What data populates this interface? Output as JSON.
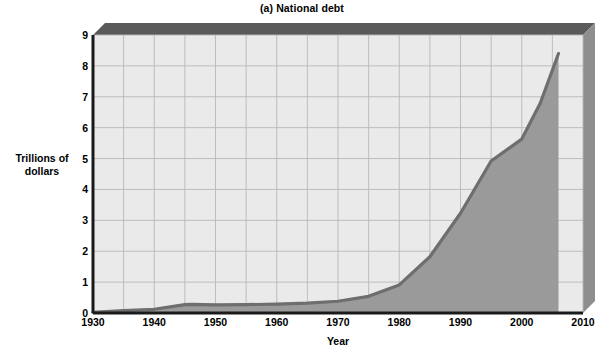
{
  "chart_data": {
    "type": "area",
    "title": "(a) National debt",
    "xlabel": "Year",
    "ylabel": "Trillions of\ndollars",
    "ylabel_line1": "Trillions of",
    "ylabel_line2": "dollars",
    "xlim": [
      1930,
      2010
    ],
    "ylim": [
      0,
      9
    ],
    "xticks": [
      1930,
      1940,
      1950,
      1960,
      1970,
      1980,
      1990,
      2000,
      2010
    ],
    "yticks": [
      0,
      1,
      2,
      3,
      4,
      5,
      6,
      7,
      8,
      9
    ],
    "grid": true,
    "grid_x_step": 5,
    "grid_y_step": 1,
    "legend_position": "inline-annotation",
    "annotations": [
      {
        "text_line1": "National",
        "text_line2": "debt",
        "x": 1984,
        "y": 3.3
      }
    ],
    "series": [
      {
        "name": "National debt",
        "fill_color": "#9a9a9a",
        "line_color": "#6e6e6e",
        "x": [
          1930,
          1935,
          1940,
          1945,
          1946,
          1950,
          1955,
          1960,
          1965,
          1970,
          1975,
          1980,
          1985,
          1990,
          1995,
          2000,
          2003,
          2006
        ],
        "values": [
          0.02,
          0.08,
          0.12,
          0.27,
          0.28,
          0.26,
          0.27,
          0.29,
          0.32,
          0.38,
          0.54,
          0.91,
          1.82,
          3.23,
          4.92,
          5.63,
          6.78,
          8.4
        ]
      }
    ]
  },
  "colors": {
    "plot_background": "#eaeaea",
    "grid_line": "#b8b8b8",
    "bevel_top": "#5a5a5a",
    "bevel_right": "#8e8e8e",
    "axis_line": "#1a1a1a",
    "area_fill": "#9a9a9a",
    "area_line": "#717171",
    "text": "#000000"
  }
}
